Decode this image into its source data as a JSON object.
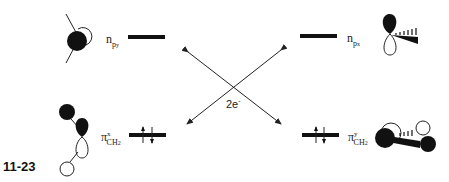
{
  "figure": {
    "id": "11-23",
    "electron_transfer_label": "2e",
    "electron_transfer_charge": "-"
  },
  "levels": {
    "top_left": {
      "symbol": "n",
      "subscript": "p",
      "subsubscript": "y",
      "occupancy": "empty"
    },
    "top_right": {
      "symbol": "n",
      "subscript": "p",
      "subsubscript": "x",
      "occupancy": "empty"
    },
    "bottom_left": {
      "symbol": "π",
      "superscript": "x",
      "subscript": "CH",
      "subsubscript": "2",
      "occupancy": "paired"
    },
    "bottom_right": {
      "symbol": "π",
      "superscript": "y",
      "subscript": "CH",
      "subsubscript": "2",
      "occupancy": "paired"
    }
  },
  "colors": {
    "ink": "#111111",
    "background": "#ffffff"
  }
}
